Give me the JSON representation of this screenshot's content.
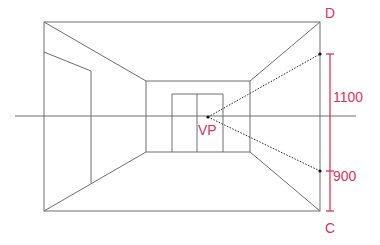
{
  "diagram": {
    "type": "one-point perspective room",
    "colors": {
      "lines": "#6e6e6e",
      "annotation": "#e0335a",
      "guide": "#222222"
    },
    "labels": {
      "vanishing_point": "VP",
      "top_corner": "D",
      "bottom_corner": "C",
      "upper_dimension": "1100",
      "lower_dimension": "900"
    },
    "elements": {
      "outer_frame": {
        "x1": 44,
        "y1": 22,
        "x2": 320,
        "y2": 211
      },
      "back_wall": {
        "x1": 146,
        "y1": 81,
        "x2": 250,
        "y2": 152
      },
      "horizon_line": {
        "y": 116,
        "x1": 15,
        "x2": 356
      },
      "vanishing_point": {
        "x": 208,
        "y": 117
      },
      "back_door": {
        "x1": 172,
        "y1": 94,
        "x2": 223,
        "y2": 152,
        "divider_x": 197
      },
      "left_wall_panel": {
        "x1": 44,
        "x2": 91,
        "top_left_y": 52,
        "top_right_y": 71,
        "bottom_right_y": 183
      },
      "dimension_line": {
        "x": 330,
        "top_y": 54,
        "mid_y": 171,
        "bottom_y": 211
      }
    }
  }
}
